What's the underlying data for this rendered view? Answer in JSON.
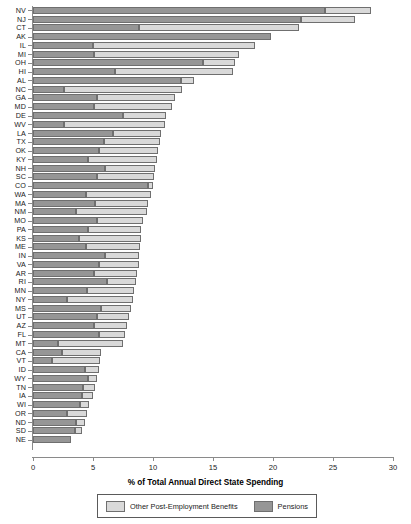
{
  "chart_data": {
    "type": "bar",
    "orientation": "horizontal",
    "stacked": true,
    "title": "",
    "xlabel": "% of Total Annual Direct State Spending",
    "ylabel": "",
    "xlim": [
      0,
      30
    ],
    "xticks": [
      0,
      5,
      10,
      15,
      20,
      25,
      30
    ],
    "grid": false,
    "legend_position": "bottom",
    "colors": {
      "pensions": "#969696",
      "opeb": "#d9d9d9",
      "axis": "#8a8a8a"
    },
    "series": [
      {
        "name": "Pensions",
        "key": "pensions"
      },
      {
        "name": "Other Post-Employment Benefits",
        "key": "opeb"
      }
    ],
    "categories": [
      "NV",
      "NJ",
      "CT",
      "AK",
      "IL",
      "MI",
      "OH",
      "HI",
      "AL",
      "NC",
      "GA",
      "MD",
      "DE",
      "WV",
      "LA",
      "TX",
      "OK",
      "KY",
      "NH",
      "SC",
      "CO",
      "WA",
      "MA",
      "NM",
      "MO",
      "PA",
      "KS",
      "ME",
      "IN",
      "VA",
      "AR",
      "RI",
      "MN",
      "NY",
      "MS",
      "UT",
      "AZ",
      "FL",
      "MT",
      "CA",
      "VT",
      "ID",
      "WY",
      "TN",
      "IA",
      "WI",
      "OR",
      "ND",
      "SD",
      "NE"
    ],
    "pensions": [
      24.3,
      22.3,
      8.8,
      19.8,
      5.0,
      5.1,
      14.2,
      6.8,
      12.3,
      2.6,
      5.3,
      5.1,
      7.5,
      2.6,
      6.7,
      5.9,
      5.5,
      4.6,
      6.0,
      5.3,
      9.6,
      4.4,
      5.2,
      3.6,
      5.3,
      4.6,
      3.8,
      4.4,
      6.0,
      5.5,
      5.1,
      6.2,
      4.5,
      2.8,
      5.7,
      5.3,
      5.1,
      5.5,
      2.1,
      2.4,
      1.6,
      4.3,
      4.6,
      4.2,
      4.1,
      3.9,
      2.8,
      3.6,
      3.5,
      3.2
    ],
    "opeb": [
      3.9,
      4.5,
      13.4,
      0.0,
      13.5,
      12.1,
      2.6,
      9.9,
      1.1,
      9.8,
      6.5,
      6.5,
      3.6,
      8.4,
      4.0,
      4.7,
      4.9,
      5.7,
      4.2,
      4.8,
      0.4,
      5.4,
      4.4,
      5.9,
      3.9,
      4.4,
      5.2,
      4.5,
      2.8,
      3.3,
      3.6,
      2.4,
      3.9,
      5.5,
      2.5,
      2.7,
      2.7,
      2.2,
      5.4,
      3.3,
      4.0,
      1.2,
      0.7,
      1.0,
      0.9,
      0.8,
      1.7,
      0.7,
      0.6,
      0.0
    ],
    "totals": [
      28.2,
      26.8,
      22.2,
      19.8,
      18.5,
      17.2,
      16.8,
      16.7,
      13.4,
      12.4,
      11.8,
      11.6,
      11.1,
      11.0,
      10.7,
      10.6,
      10.4,
      10.3,
      10.2,
      10.1,
      10.0,
      9.8,
      9.6,
      9.5,
      9.2,
      9.0,
      9.0,
      8.9,
      8.8,
      8.8,
      8.7,
      8.6,
      8.4,
      8.3,
      8.2,
      8.0,
      7.8,
      7.7,
      7.5,
      5.7,
      5.6,
      5.5,
      5.3,
      5.2,
      5.0,
      4.7,
      4.5,
      4.3,
      4.1,
      3.2
    ]
  },
  "legend": {
    "opeb_label": "Other Post-Employment Benefits",
    "pensions_label": "Pensions"
  },
  "axis": {
    "xtitle": "% of Total Annual Direct State Spending"
  }
}
